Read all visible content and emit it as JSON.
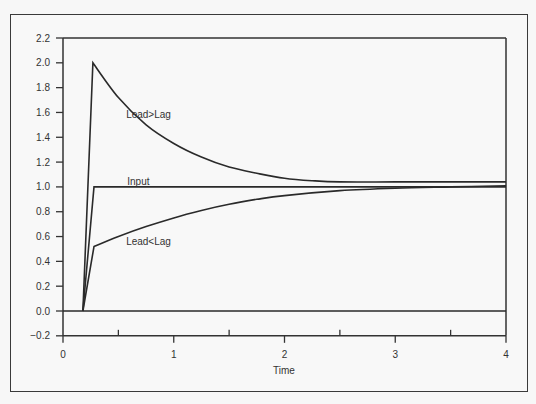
{
  "chart_data": {
    "type": "line",
    "title": "",
    "xlabel": "Time",
    "ylabel": "",
    "xlim": [
      0,
      4
    ],
    "ylim": [
      -0.2,
      2.2
    ],
    "grid": false,
    "legend": "inline labels",
    "x_ticks": [
      0,
      1,
      2,
      3,
      4
    ],
    "x_minor_ticks": [
      0.5,
      1.5,
      2.5,
      3.5
    ],
    "x_tick_labels": [
      "0",
      "1",
      "2",
      "3",
      "4"
    ],
    "y_ticks": [
      -0.2,
      0.0,
      0.2,
      0.4,
      0.6,
      0.8,
      1.0,
      1.2,
      1.4,
      1.6,
      1.8,
      2.0,
      2.2
    ],
    "y_tick_labels": [
      "−0.2",
      "0.0",
      "0.2",
      "0.4",
      "0.6",
      "0.8",
      "1.0",
      "1.2",
      "1.4",
      "1.6",
      "1.8",
      "2.0",
      "2.2"
    ],
    "series": [
      {
        "name": "Input",
        "label": "Input",
        "x": [
          0.18,
          0.28,
          4.0
        ],
        "y": [
          0.0,
          1.0,
          1.0
        ]
      },
      {
        "name": "Lead>Lag",
        "label": "Lead>Lag",
        "x": [
          0.18,
          0.27,
          0.5,
          0.75,
          1.0,
          1.25,
          1.5,
          1.75,
          2.0,
          2.25,
          2.5,
          3.0,
          3.5,
          4.0
        ],
        "y": [
          0.0,
          2.0,
          1.72,
          1.5,
          1.35,
          1.24,
          1.16,
          1.11,
          1.07,
          1.05,
          1.04,
          1.04,
          1.04,
          1.04
        ]
      },
      {
        "name": "Lead<Lag",
        "label": "Lead<Lag",
        "x": [
          0.18,
          0.28,
          0.5,
          0.75,
          1.0,
          1.25,
          1.5,
          1.75,
          2.0,
          2.5,
          3.0,
          3.5,
          4.0
        ],
        "y": [
          0.0,
          0.52,
          0.6,
          0.68,
          0.75,
          0.81,
          0.86,
          0.9,
          0.93,
          0.97,
          0.99,
          1.0,
          1.01
        ]
      },
      {
        "name": "Zero line",
        "label": "",
        "x": [
          0.0,
          4.0
        ],
        "y": [
          0.0,
          0.0
        ]
      }
    ],
    "annotations": [
      {
        "text": "Lead>Lag",
        "x": 0.57,
        "y": 1.58
      },
      {
        "text": "Input",
        "x": 0.58,
        "y": 1.04
      },
      {
        "text": "Lead<Lag",
        "x": 0.57,
        "y": 0.56
      }
    ]
  },
  "labels": {
    "xlabel": "Time",
    "series_input": "Input",
    "series_leadgtlag": "Lead>Lag",
    "series_leadltlag": "Lead<Lag"
  },
  "colors": {
    "line": "#2a2a2a",
    "axis": "#333333",
    "background": "#f8f8f8"
  }
}
